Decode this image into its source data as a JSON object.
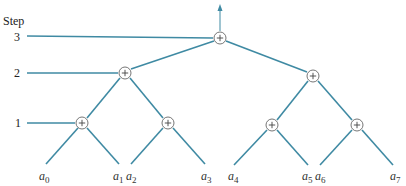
{
  "axis": {
    "title": "Step",
    "steps": [
      {
        "label": "3",
        "y": 38
      },
      {
        "label": "2",
        "y": 73
      },
      {
        "label": "1",
        "y": 123
      }
    ]
  },
  "colors": {
    "edge": "#3f8aa3",
    "node_stroke": "#666666"
  },
  "nodes": [
    {
      "id": "n3",
      "step": 3,
      "x": 220,
      "y": 38,
      "symbol": "+"
    },
    {
      "id": "n2a",
      "step": 2,
      "x": 125,
      "y": 73,
      "symbol": "+"
    },
    {
      "id": "n2b",
      "step": 2,
      "x": 313,
      "y": 76,
      "symbol": "+"
    },
    {
      "id": "n1a",
      "step": 1,
      "x": 82,
      "y": 123,
      "symbol": "+"
    },
    {
      "id": "n1b",
      "step": 1,
      "x": 168,
      "y": 123,
      "symbol": "+"
    },
    {
      "id": "n1c",
      "step": 1,
      "x": 272,
      "y": 125,
      "symbol": "+"
    },
    {
      "id": "n1d",
      "step": 1,
      "x": 357,
      "y": 125,
      "symbol": "+"
    }
  ],
  "leaves": [
    {
      "base": "a",
      "sub": "0",
      "x": 45
    },
    {
      "base": "a",
      "sub": "1",
      "x": 120
    },
    {
      "base": "a",
      "sub": "2",
      "x": 131
    },
    {
      "base": "a",
      "sub": "3",
      "x": 206
    },
    {
      "base": "a",
      "sub": "4",
      "x": 233
    },
    {
      "base": "a",
      "sub": "5",
      "x": 308
    },
    {
      "base": "a",
      "sub": "6",
      "x": 320
    },
    {
      "base": "a",
      "sub": "7",
      "x": 394
    }
  ]
}
